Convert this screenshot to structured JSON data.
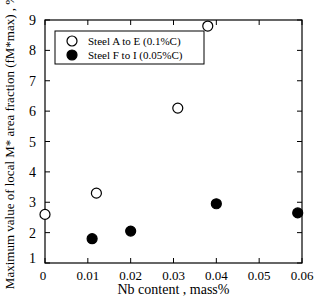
{
  "chart_data": {
    "type": "scatter",
    "title": "",
    "xlabel": "Nb content , mass%",
    "ylabel": "Maximum value of local M* area fraction (fM*max) , %",
    "xlim": [
      0,
      0.06
    ],
    "ylim": [
      1,
      9
    ],
    "xticks": [
      "0",
      "0.01",
      "0.02",
      "0.03",
      "0.04",
      "0.05",
      "0.06"
    ],
    "yticks": [
      "1",
      "2",
      "3",
      "4",
      "5",
      "6",
      "7",
      "8",
      "9"
    ],
    "legend_position": "upper left",
    "series": [
      {
        "name": "Steel A to E (0.1%C)",
        "marker": "open-circle",
        "x": [
          0,
          0.012,
          0.031,
          0.038
        ],
        "y": [
          2.6,
          3.3,
          6.1,
          8.8
        ]
      },
      {
        "name": "Steel F to I (0.05%C)",
        "marker": "filled-circle",
        "x": [
          0.011,
          0.02,
          0.04,
          0.059
        ],
        "y": [
          1.8,
          2.05,
          2.95,
          2.65
        ]
      }
    ]
  }
}
